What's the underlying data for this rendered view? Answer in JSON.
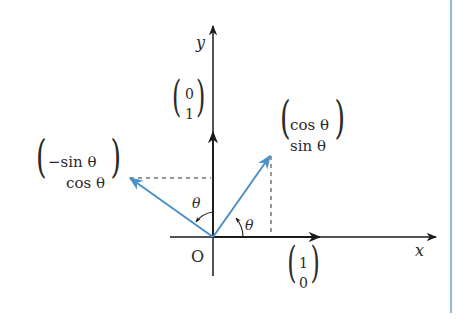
{
  "diagram": {
    "colors": {
      "axis": "#1a1a1a",
      "vector": "#4a90c8",
      "dashed": "#333333",
      "side_rule": "#8fb8dc"
    },
    "axes": {
      "x_label": "x",
      "y_label": "y",
      "origin_label": "O"
    },
    "vectors": {
      "e1": {
        "top": "1",
        "bottom": "0"
      },
      "e2": {
        "top": "0",
        "bottom": "1"
      },
      "rot_e1": {
        "top": "cos θ",
        "bottom": "sin θ"
      },
      "rot_e2": {
        "top": "−sin θ",
        "bottom": "cos θ"
      }
    },
    "angles": {
      "angle1": "θ",
      "angle2": "θ"
    }
  }
}
